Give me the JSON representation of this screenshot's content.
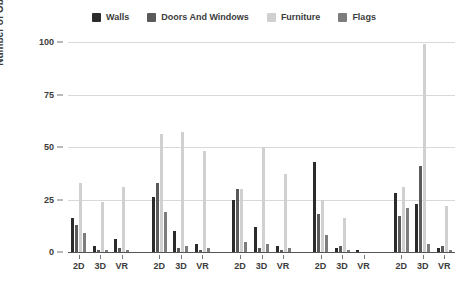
{
  "chart_data": {
    "type": "bar",
    "title": "",
    "xlabel": "",
    "ylabel": "Number of Objects",
    "ylim": [
      0,
      100
    ],
    "yticks": [
      0,
      25,
      50,
      75,
      100
    ],
    "grid": true,
    "legend_position": "top-center",
    "categories": [
      "2D",
      "3D",
      "VR",
      "2D",
      "3D",
      "VR",
      "2D",
      "3D",
      "VR",
      "2D",
      "3D",
      "VR",
      "2D",
      "3D",
      "VR"
    ],
    "groups": [
      "Group 1",
      "Group 2",
      "Group 3",
      "Group 4",
      "Group 5"
    ],
    "series": [
      {
        "name": "Walls",
        "color": "#2b2b2b",
        "values": [
          16,
          3,
          6,
          26,
          10,
          4,
          25,
          12,
          3,
          43,
          2,
          1,
          28,
          23,
          2
        ]
      },
      {
        "name": "Doors And Windows",
        "color": "#5a5a5a",
        "values": [
          13,
          1,
          2,
          33,
          2,
          1,
          30,
          2,
          1,
          18,
          3,
          0,
          17,
          41,
          3
        ]
      },
      {
        "name": "Furniture",
        "color": "#d0d0d0",
        "values": [
          33,
          24,
          31,
          56,
          57,
          48,
          30,
          50,
          37,
          25,
          16,
          0,
          31,
          99,
          22
        ]
      },
      {
        "name": "Flags",
        "color": "#7d7d7d",
        "values": [
          9,
          1,
          1,
          19,
          3,
          2,
          5,
          4,
          2,
          8,
          1,
          0,
          21,
          4,
          1
        ]
      }
    ]
  },
  "legend": {
    "items": [
      {
        "label": "Walls",
        "color": "#2b2b2b"
      },
      {
        "label": "Doors And Windows",
        "color": "#5a5a5a"
      },
      {
        "label": "Furniture",
        "color": "#d0d0d0"
      },
      {
        "label": "Flags",
        "color": "#7d7d7d"
      }
    ]
  },
  "axes": {
    "y_title": "Number of Objects",
    "y_ticks": [
      "0",
      "25",
      "50",
      "75",
      "100"
    ],
    "x_ticks": [
      "2D",
      "3D",
      "VR",
      "2D",
      "3D",
      "VR",
      "2D",
      "3D",
      "VR",
      "2D",
      "3D",
      "VR",
      "2D",
      "3D",
      "VR"
    ]
  }
}
